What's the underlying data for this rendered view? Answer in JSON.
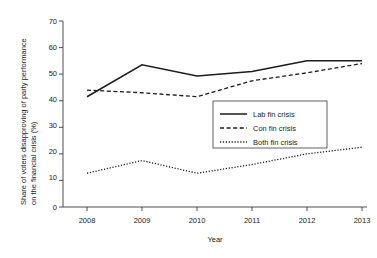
{
  "chart_data": {
    "type": "line",
    "title": "",
    "subtitle": "",
    "xlabel": "Year",
    "ylabel": "Share of voters disapproving of party performance on the financial crisis (%)",
    "ylabel_line1": "Share of voters disapproving of party performance",
    "ylabel_line2": "on the financial crisis (%)",
    "categories": [
      "2008",
      "2009",
      "2010",
      "2011",
      "2012",
      "2013"
    ],
    "x": [
      2008,
      2009,
      2010,
      2011,
      2012,
      2013
    ],
    "xlim": [
      2008,
      2013
    ],
    "ylim": [
      0,
      70
    ],
    "yticks": [
      0,
      10,
      20,
      30,
      40,
      50,
      60,
      70
    ],
    "ytick_labels": [
      "0",
      "10",
      "20",
      "30",
      "40",
      "50",
      "60",
      "70"
    ],
    "xtick_labels": [
      "2008",
      "2009",
      "2010",
      "2011",
      "2012",
      "2013"
    ],
    "grid": false,
    "legend_position": "center-right",
    "series": [
      {
        "name": "Lab fin crisis",
        "style": "solid",
        "color": "#1c1c1c",
        "values": [
          41.5,
          53.5,
          49.3,
          51.0,
          55.0,
          55.0
        ]
      },
      {
        "name": "Con fin crisis",
        "style": "dashed",
        "color": "#1c1c1c",
        "values": [
          44.0,
          43.0,
          41.5,
          47.5,
          50.5,
          54.0
        ]
      },
      {
        "name": "Both fin crisis",
        "style": "dotted",
        "color": "#1c1c1c",
        "values": [
          12.7,
          17.5,
          12.7,
          16.0,
          20.0,
          22.5
        ]
      }
    ]
  },
  "legend": {
    "items": [
      {
        "label": "Lab fin crisis"
      },
      {
        "label": "Con fin crisis"
      },
      {
        "label": "Both fin crisis"
      }
    ]
  },
  "axes": {
    "y_title_line1": "Share of voters disapproving of party performance",
    "y_title_line2": "on the financial crisis (%)",
    "x_title": "Year"
  }
}
